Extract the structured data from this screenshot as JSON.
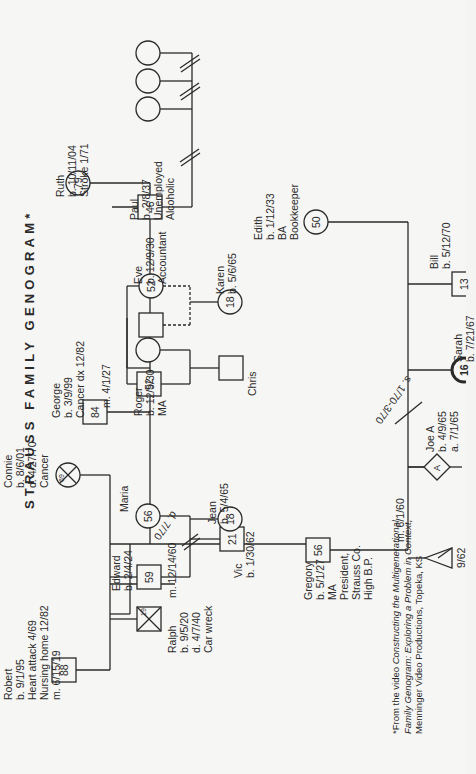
{
  "title": "STRAUSS FAMILY GENOGRAM*",
  "footnote": {
    "line1_prefix": "*From the video ",
    "line1_italic": "Constructing the Multigenerational",
    "line2_italic": "Family Genogram: Exploring a Problem in Context,",
    "line3": "Menninger Video Productions, Topeka, KS"
  },
  "people": {
    "robert": {
      "name": "Robert",
      "age": "88",
      "details": [
        "b. 9/1/95",
        "Heart attack 4/69",
        "Nursing home 12/82"
      ],
      "marriage": "m. 6/15/19"
    },
    "connie": {
      "name": "Connie",
      "age": "69",
      "details": [
        "b. 8/6/01",
        "d. 4/27/70",
        "Cancer"
      ]
    },
    "ralph": {
      "name": "Ralph",
      "age": "19",
      "details": [
        "b. 9/5/20",
        "d. 4/7/40",
        "Car wreck"
      ]
    },
    "edward": {
      "name": "Edward",
      "age": "59",
      "details": [
        "b. 2/4/24"
      ],
      "marriage": "m. 12/14/60"
    },
    "maria": {
      "name": "Maria",
      "age": "56",
      "divorce": "d. 7/70"
    },
    "vic": {
      "name": "Vic",
      "age": "21",
      "details": [
        "b. 1/30/62"
      ]
    },
    "jean": {
      "name": "Jean",
      "age": "18",
      "details": [
        "b. 5/4/65"
      ]
    },
    "gregory": {
      "name": "Gregory",
      "age": "56",
      "details": [
        "b. 5/1/27",
        "MA",
        "President,",
        "Strauss Co.",
        "High B.P."
      ],
      "marriage": "m. 6/1/60"
    },
    "george": {
      "name": "George",
      "age": "84",
      "details": [
        "b. 3/9/99",
        "Cancer dx 12/82"
      ],
      "marriage": "m. 4/1/27"
    },
    "ruth": {
      "name": "Ruth",
      "age": "79",
      "details": [
        "b. 10/11/04",
        "Stroke 1/71"
      ]
    },
    "roger": {
      "name": "Roger",
      "age": "52",
      "details": [
        "b. 12/9/30",
        "MA"
      ]
    },
    "eve": {
      "name": "Eve",
      "age": "52",
      "details": [
        "b. 12/9/30",
        "Accountant"
      ]
    },
    "chris": {
      "name": "Chris"
    },
    "karen": {
      "name": "Karen",
      "age": "18",
      "details": [
        "b. 5/6/65"
      ]
    },
    "paul": {
      "name": "Paul",
      "age": "46",
      "details": [
        "b. 2/8/37",
        "Unemployed",
        "Alcoholic"
      ]
    },
    "edith": {
      "name": "Edith",
      "age": "50",
      "details": [
        "b. 1/12/33",
        "BA",
        "Bookkeeper"
      ],
      "separation": "s. 1/70-3/70"
    },
    "miscarriage": {
      "label": "9/62"
    },
    "adoption": {
      "symbol": "A"
    },
    "joe": {
      "name": "Joe A",
      "age": "18",
      "details": [
        "b. 4/9/65",
        "a. 7/1/65"
      ]
    },
    "sarah": {
      "name": "Sarah",
      "age": "16",
      "details": [
        "b. 7/21/67"
      ]
    },
    "bill": {
      "name": "Bill",
      "age": "13",
      "details": [
        "b. 5/12/70"
      ]
    }
  }
}
